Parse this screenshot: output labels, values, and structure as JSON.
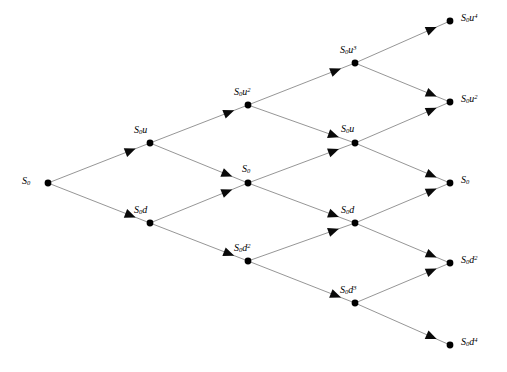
{
  "diagram": {
    "type": "binomial-tree",
    "steps": 4,
    "colors": {
      "background": "#ffffff",
      "edge": "#8a8a8a",
      "node": "#000000",
      "arrow": "#0a0a0a",
      "label": "#000000"
    },
    "geometry": {
      "columns_x": [
        48,
        150,
        248,
        355,
        450
      ],
      "center_y": 183,
      "y_step": 40,
      "node_radius": 3.4
    },
    "nodes": [
      {
        "id": "n0_0",
        "step": 0,
        "up": 0,
        "x": 48,
        "y": 183,
        "base": "S",
        "sub": "0",
        "sup": "",
        "label_x": 22,
        "label_y": 176
      },
      {
        "id": "n1_1",
        "step": 1,
        "up": 1,
        "x": 150,
        "y": 143,
        "base": "S",
        "sub": "0",
        "sup": "u",
        "label_x": 134,
        "label_y": 125
      },
      {
        "id": "n1_0",
        "step": 1,
        "up": 0,
        "x": 150,
        "y": 223,
        "base": "S",
        "sub": "0",
        "sup": "d",
        "label_x": 134,
        "label_y": 205
      },
      {
        "id": "n2_2",
        "step": 2,
        "up": 2,
        "x": 248,
        "y": 105,
        "base": "S",
        "sub": "0",
        "sup": "u2",
        "label_x": 234,
        "label_y": 87
      },
      {
        "id": "n2_1",
        "step": 2,
        "up": 1,
        "x": 248,
        "y": 183,
        "base": "S",
        "sub": "0",
        "sup": "",
        "label_x": 242,
        "label_y": 164
      },
      {
        "id": "n2_0",
        "step": 2,
        "up": 0,
        "x": 248,
        "y": 261,
        "base": "S",
        "sub": "0",
        "sup": "d2",
        "label_x": 234,
        "label_y": 243
      },
      {
        "id": "n3_3",
        "step": 3,
        "up": 3,
        "x": 355,
        "y": 63,
        "base": "S",
        "sub": "0",
        "sup": "u3",
        "label_x": 340,
        "label_y": 45
      },
      {
        "id": "n3_2",
        "step": 3,
        "up": 2,
        "x": 355,
        "y": 143,
        "base": "S",
        "sub": "0",
        "sup": "u",
        "label_x": 341,
        "label_y": 124
      },
      {
        "id": "n3_1",
        "step": 3,
        "up": 1,
        "x": 355,
        "y": 223,
        "base": "S",
        "sub": "0",
        "sup": "d",
        "label_x": 341,
        "label_y": 205
      },
      {
        "id": "n3_0",
        "step": 3,
        "up": 0,
        "x": 355,
        "y": 303,
        "base": "S",
        "sub": "0",
        "sup": "d3",
        "label_x": 340,
        "label_y": 285
      },
      {
        "id": "n4_4",
        "step": 4,
        "up": 4,
        "x": 450,
        "y": 21,
        "base": "S",
        "sub": "0",
        "sup": "u4",
        "label_x": 461,
        "label_y": 13
      },
      {
        "id": "n4_3",
        "step": 4,
        "up": 3,
        "x": 450,
        "y": 102,
        "base": "S",
        "sub": "0",
        "sup": "u2",
        "label_x": 461,
        "label_y": 94
      },
      {
        "id": "n4_2",
        "step": 4,
        "up": 2,
        "x": 450,
        "y": 183,
        "base": "S",
        "sub": "0",
        "sup": "",
        "label_x": 461,
        "label_y": 175
      },
      {
        "id": "n4_1",
        "step": 4,
        "up": 1,
        "x": 450,
        "y": 263,
        "base": "S",
        "sub": "0",
        "sup": "d2",
        "label_x": 461,
        "label_y": 255
      },
      {
        "id": "n4_0",
        "step": 4,
        "up": 0,
        "x": 450,
        "y": 345,
        "base": "S",
        "sub": "0",
        "sup": "d4",
        "label_x": 461,
        "label_y": 337
      }
    ],
    "edges": [
      {
        "from": "n0_0",
        "to": "n1_1",
        "kind": "up",
        "arrow_t": 0.86
      },
      {
        "from": "n0_0",
        "to": "n1_0",
        "kind": "down",
        "arrow_t": 0.86
      },
      {
        "from": "n1_1",
        "to": "n2_2",
        "kind": "up",
        "arrow_t": 0.86
      },
      {
        "from": "n1_1",
        "to": "n2_1",
        "kind": "down",
        "arrow_t": 0.84
      },
      {
        "from": "n1_0",
        "to": "n2_1",
        "kind": "up",
        "arrow_t": 0.84
      },
      {
        "from": "n1_0",
        "to": "n2_0",
        "kind": "down",
        "arrow_t": 0.86
      },
      {
        "from": "n2_2",
        "to": "n3_3",
        "kind": "up",
        "arrow_t": 0.87
      },
      {
        "from": "n2_2",
        "to": "n3_2",
        "kind": "down",
        "arrow_t": 0.85
      },
      {
        "from": "n2_1",
        "to": "n3_2",
        "kind": "up",
        "arrow_t": 0.85
      },
      {
        "from": "n2_1",
        "to": "n3_1",
        "kind": "down",
        "arrow_t": 0.85
      },
      {
        "from": "n2_0",
        "to": "n3_1",
        "kind": "up",
        "arrow_t": 0.85
      },
      {
        "from": "n2_0",
        "to": "n3_0",
        "kind": "down",
        "arrow_t": 0.87
      },
      {
        "from": "n3_3",
        "to": "n4_4",
        "kind": "up",
        "arrow_t": 0.86
      },
      {
        "from": "n3_3",
        "to": "n4_3",
        "kind": "down",
        "arrow_t": 0.86
      },
      {
        "from": "n3_2",
        "to": "n4_3",
        "kind": "up",
        "arrow_t": 0.86
      },
      {
        "from": "n3_2",
        "to": "n4_2",
        "kind": "down",
        "arrow_t": 0.86
      },
      {
        "from": "n3_1",
        "to": "n4_2",
        "kind": "up",
        "arrow_t": 0.86
      },
      {
        "from": "n3_1",
        "to": "n4_1",
        "kind": "down",
        "arrow_t": 0.86
      },
      {
        "from": "n3_0",
        "to": "n4_1",
        "kind": "up",
        "arrow_t": 0.86
      },
      {
        "from": "n3_0",
        "to": "n4_0",
        "kind": "down",
        "arrow_t": 0.86
      }
    ]
  }
}
